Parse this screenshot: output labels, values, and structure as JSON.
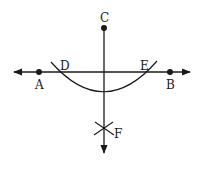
{
  "diagram": {
    "type": "geometric-construction",
    "colors": {
      "stroke": "#1a1a1a",
      "background": "#ffffff"
    },
    "points": [
      {
        "id": "A",
        "label": "A",
        "x": 39,
        "y": 72
      },
      {
        "id": "B",
        "label": "B",
        "x": 170,
        "y": 72
      },
      {
        "id": "C",
        "label": "C",
        "x": 104,
        "y": 28
      },
      {
        "id": "D",
        "label": "D",
        "x": 57,
        "y": 72
      },
      {
        "id": "E",
        "label": "E",
        "x": 152,
        "y": 72
      },
      {
        "id": "F",
        "label": "F",
        "x": 104,
        "y": 128
      }
    ],
    "lines": [
      {
        "id": "line-AB",
        "from": [
          12,
          72
        ],
        "to": [
          192,
          72
        ],
        "arrows": "both"
      },
      {
        "id": "perpendicular-CF",
        "from": [
          104,
          28
        ],
        "to": [
          104,
          155
        ],
        "arrows": "end"
      }
    ],
    "arcs": [
      {
        "id": "arc-DE",
        "center": "C",
        "through": [
          "D",
          "E"
        ]
      }
    ],
    "marks": [
      {
        "id": "cross-F",
        "at": "F"
      }
    ]
  }
}
